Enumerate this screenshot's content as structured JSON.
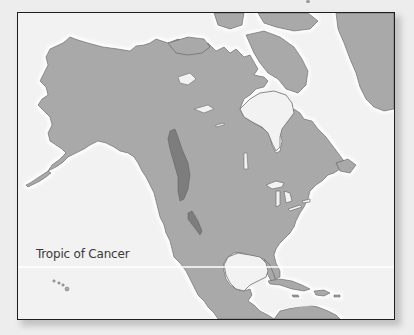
{
  "map": {
    "subject": "North America",
    "labels": {
      "tropic_of_cancer": "Tropic of Cancer"
    },
    "features": [
      {
        "name": "land",
        "color": "#a9a9a9"
      },
      {
        "name": "water",
        "color": "#f2f2f2"
      },
      {
        "name": "highlighted-mountain-range",
        "color": "#7d7d7d"
      },
      {
        "name": "coastline",
        "color": "#6e6e6e"
      },
      {
        "name": "tropic-of-cancer-line",
        "color": "#ffffff"
      },
      {
        "name": "frame-border",
        "color": "#1e1e1e"
      }
    ]
  }
}
